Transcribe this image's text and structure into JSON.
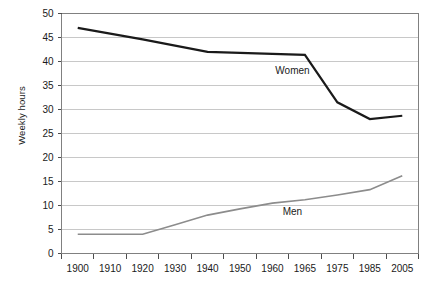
{
  "chart_data": {
    "type": "line",
    "title": "",
    "xlabel": "",
    "ylabel": "Weekly hours",
    "categories": [
      "1900",
      "1910",
      "1920",
      "1930",
      "1940",
      "1950",
      "1960",
      "1965",
      "1975",
      "1985",
      "2005"
    ],
    "ylim": [
      0,
      50
    ],
    "ytick_step": 5,
    "yticks": [
      "0",
      "5",
      "10",
      "15",
      "20",
      "25",
      "30",
      "35",
      "40",
      "45",
      "50"
    ],
    "grid": "horizontal",
    "legend_position": "inline-annotations",
    "series": [
      {
        "name": "Women",
        "color": "#1a1a1a",
        "width": 2.2,
        "values": [
          47.0,
          45.8,
          44.6,
          43.3,
          42.0,
          41.8,
          41.6,
          41.4,
          31.5,
          28.0,
          28.7
        ],
        "label_x_category": "1960",
        "label_y_value": 37.5
      },
      {
        "name": "Men",
        "color": "#8c8c8c",
        "width": 1.6,
        "values": [
          4.0,
          4.0,
          4.0,
          6.0,
          8.0,
          9.3,
          10.5,
          11.2,
          12.2,
          13.3,
          16.2
        ],
        "label_x_category": "1960",
        "label_y_value": 8.0
      }
    ]
  },
  "axes": {
    "y_axis_title": "Weekly hours",
    "frame_color": "#808080",
    "grid_color": "#c8c8c8"
  }
}
